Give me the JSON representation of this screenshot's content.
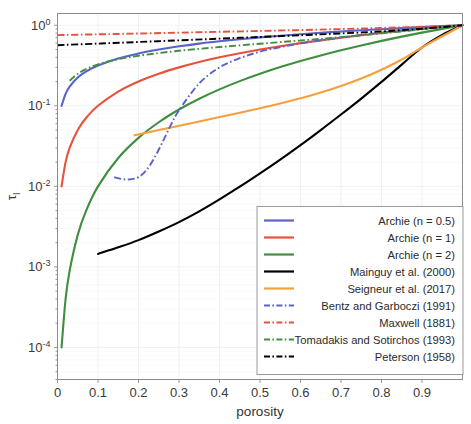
{
  "chart_data": {
    "type": "line",
    "title": "",
    "xlabel": "porosity",
    "ylabel": "τ",
    "ylabel_sub": "l",
    "xlim": [
      0,
      1
    ],
    "ylim": [
      4e-05,
      1.4
    ],
    "yscale": "log",
    "xscale": "linear",
    "grid": true,
    "legend_position": "lower right",
    "xticks": [
      0,
      0.1,
      0.2,
      0.3,
      0.4,
      0.5,
      0.6,
      0.7,
      0.8,
      0.9
    ],
    "xtick_labels": [
      "0",
      "0.1",
      "0.2",
      "0.3",
      "0.4",
      "0.5",
      "0.6",
      "0.7",
      "0.8",
      "0.9"
    ],
    "yticks": [
      1,
      0.1,
      0.01,
      0.001,
      0.0001
    ],
    "ytick_labels": [
      "10⁰",
      "10⁻¹",
      "10⁻²",
      "10⁻³",
      "10⁻⁴"
    ],
    "ytick_mantissa": [
      "10",
      "10",
      "10",
      "10",
      "10"
    ],
    "ytick_exponent": [
      "0",
      "-1",
      "-2",
      "-3",
      "-4"
    ],
    "series": [
      {
        "name": "Archie (n = 0.5)",
        "color": "#5b62c9",
        "style": "solid",
        "x": [
          0.01,
          0.02,
          0.03,
          0.05,
          0.07,
          0.1,
          0.15,
          0.2,
          0.25,
          0.3,
          0.35,
          0.4,
          0.45,
          0.5,
          0.55,
          0.6,
          0.65,
          0.7,
          0.75,
          0.8,
          0.85,
          0.9,
          0.95,
          1.0
        ],
        "y": [
          0.1,
          0.141,
          0.173,
          0.224,
          0.265,
          0.316,
          0.387,
          0.447,
          0.5,
          0.548,
          0.592,
          0.632,
          0.671,
          0.707,
          0.742,
          0.775,
          0.806,
          0.837,
          0.866,
          0.894,
          0.922,
          0.949,
          0.975,
          1.0
        ]
      },
      {
        "name": "Archie (n = 1)",
        "color": "#e8513c",
        "style": "solid",
        "x": [
          0.01,
          0.02,
          0.03,
          0.05,
          0.07,
          0.1,
          0.15,
          0.2,
          0.25,
          0.3,
          0.35,
          0.4,
          0.45,
          0.5,
          0.55,
          0.6,
          0.65,
          0.7,
          0.75,
          0.8,
          0.85,
          0.9,
          0.95,
          1.0
        ],
        "y": [
          0.01,
          0.02,
          0.03,
          0.05,
          0.07,
          0.1,
          0.15,
          0.2,
          0.25,
          0.3,
          0.35,
          0.4,
          0.45,
          0.5,
          0.55,
          0.6,
          0.65,
          0.7,
          0.75,
          0.8,
          0.85,
          0.9,
          0.95,
          1.0
        ]
      },
      {
        "name": "Archie (n = 2)",
        "color": "#3f8f3f",
        "style": "solid",
        "x": [
          0.01,
          0.02,
          0.03,
          0.05,
          0.07,
          0.1,
          0.15,
          0.2,
          0.25,
          0.3,
          0.35,
          0.4,
          0.45,
          0.5,
          0.55,
          0.6,
          0.65,
          0.7,
          0.75,
          0.8,
          0.85,
          0.9,
          0.95,
          1.0
        ],
        "y": [
          0.0001,
          0.0004,
          0.0009,
          0.0025,
          0.0049,
          0.01,
          0.0225,
          0.04,
          0.0625,
          0.09,
          0.1225,
          0.16,
          0.2025,
          0.25,
          0.3025,
          0.36,
          0.4225,
          0.49,
          0.5625,
          0.64,
          0.7225,
          0.81,
          0.9025,
          1.0
        ]
      },
      {
        "name": "Mainguy et al. (2000)",
        "color": "#000000",
        "style": "solid",
        "x": [
          0.1,
          0.15,
          0.2,
          0.25,
          0.3,
          0.35,
          0.4,
          0.45,
          0.5,
          0.55,
          0.6,
          0.65,
          0.7,
          0.75,
          0.8,
          0.85,
          0.9,
          0.95,
          1.0
        ],
        "y": [
          0.00145,
          0.00175,
          0.00215,
          0.00275,
          0.0036,
          0.0049,
          0.0069,
          0.0099,
          0.0145,
          0.0215,
          0.0325,
          0.05,
          0.078,
          0.123,
          0.198,
          0.325,
          0.53,
          0.76,
          1.0
        ]
      },
      {
        "name": "Seigneur et al. (2017)",
        "color": "#f5a03c",
        "style": "solid",
        "x": [
          0.19,
          0.25,
          0.3,
          0.35,
          0.4,
          0.45,
          0.5,
          0.55,
          0.6,
          0.65,
          0.7,
          0.75,
          0.8,
          0.85,
          0.9,
          0.95,
          1.0
        ],
        "y": [
          0.043,
          0.05,
          0.0565,
          0.064,
          0.0725,
          0.082,
          0.0935,
          0.107,
          0.124,
          0.146,
          0.176,
          0.218,
          0.28,
          0.376,
          0.53,
          0.73,
          1.0
        ]
      },
      {
        "name": "Bentz and Garboczi (1991)",
        "color": "#5b62c9",
        "style": "dashdot",
        "x": [
          0.14,
          0.16,
          0.18,
          0.2,
          0.22,
          0.24,
          0.26,
          0.28,
          0.3,
          0.35,
          0.4,
          0.45,
          0.5,
          0.55,
          0.6,
          0.65,
          0.7,
          0.75,
          0.8,
          0.85,
          0.9,
          0.95,
          1.0
        ],
        "y": [
          0.013,
          0.0123,
          0.0122,
          0.013,
          0.016,
          0.023,
          0.036,
          0.058,
          0.088,
          0.19,
          0.3,
          0.39,
          0.47,
          0.535,
          0.595,
          0.65,
          0.705,
          0.76,
          0.815,
          0.87,
          0.92,
          0.965,
          1.0
        ]
      },
      {
        "name": "Maxwell (1881)",
        "color": "#e8513c",
        "style": "dashdot",
        "x": [
          0.0,
          0.1,
          0.2,
          0.3,
          0.4,
          0.5,
          0.6,
          0.7,
          0.8,
          0.9,
          1.0
        ],
        "y": [
          0.755,
          0.772,
          0.79,
          0.81,
          0.83,
          0.85,
          0.872,
          0.898,
          0.925,
          0.96,
          1.0
        ]
      },
      {
        "name": "Tomadakis and Sotirchos (1993)",
        "color": "#3f8f3f",
        "style": "dashdot",
        "x": [
          0.03,
          0.05,
          0.08,
          0.12,
          0.16,
          0.2,
          0.25,
          0.3,
          0.35,
          0.4,
          0.45,
          0.5,
          0.55,
          0.6,
          0.65,
          0.7,
          0.75,
          0.8,
          0.85,
          0.9,
          0.95,
          1.0
        ],
        "y": [
          0.205,
          0.25,
          0.3,
          0.35,
          0.388,
          0.418,
          0.452,
          0.482,
          0.51,
          0.537,
          0.563,
          0.59,
          0.618,
          0.647,
          0.678,
          0.712,
          0.75,
          0.793,
          0.84,
          0.893,
          0.945,
          1.0
        ]
      },
      {
        "name": "Peterson (1958)",
        "color": "#000000",
        "style": "dashdot",
        "x": [
          0.0,
          0.1,
          0.2,
          0.3,
          0.4,
          0.5,
          0.6,
          0.7,
          0.8,
          0.9,
          1.0
        ],
        "y": [
          0.566,
          0.592,
          0.62,
          0.65,
          0.682,
          0.716,
          0.752,
          0.792,
          0.84,
          0.906,
          1.0
        ]
      }
    ]
  },
  "legend": {
    "items": [
      {
        "label": "Archie (n = 0.5)",
        "color": "#5b62c9",
        "style": "solid"
      },
      {
        "label": "Archie (n = 1)",
        "color": "#e8513c",
        "style": "solid"
      },
      {
        "label": "Archie (n = 2)",
        "color": "#3f8f3f",
        "style": "solid"
      },
      {
        "label": "Mainguy et al. (2000)",
        "color": "#000000",
        "style": "solid"
      },
      {
        "label": "Seigneur et al. (2017)",
        "color": "#f5a03c",
        "style": "solid"
      },
      {
        "label": "Bentz and Garboczi (1991)",
        "color": "#5b62c9",
        "style": "dashdot"
      },
      {
        "label": "Maxwell (1881)",
        "color": "#e8513c",
        "style": "dashdot"
      },
      {
        "label": "Tomadakis and Sotirchos (1993)",
        "color": "#3f8f3f",
        "style": "dashdot"
      },
      {
        "label": "Peterson (1958)",
        "color": "#000000",
        "style": "dashdot"
      }
    ]
  }
}
